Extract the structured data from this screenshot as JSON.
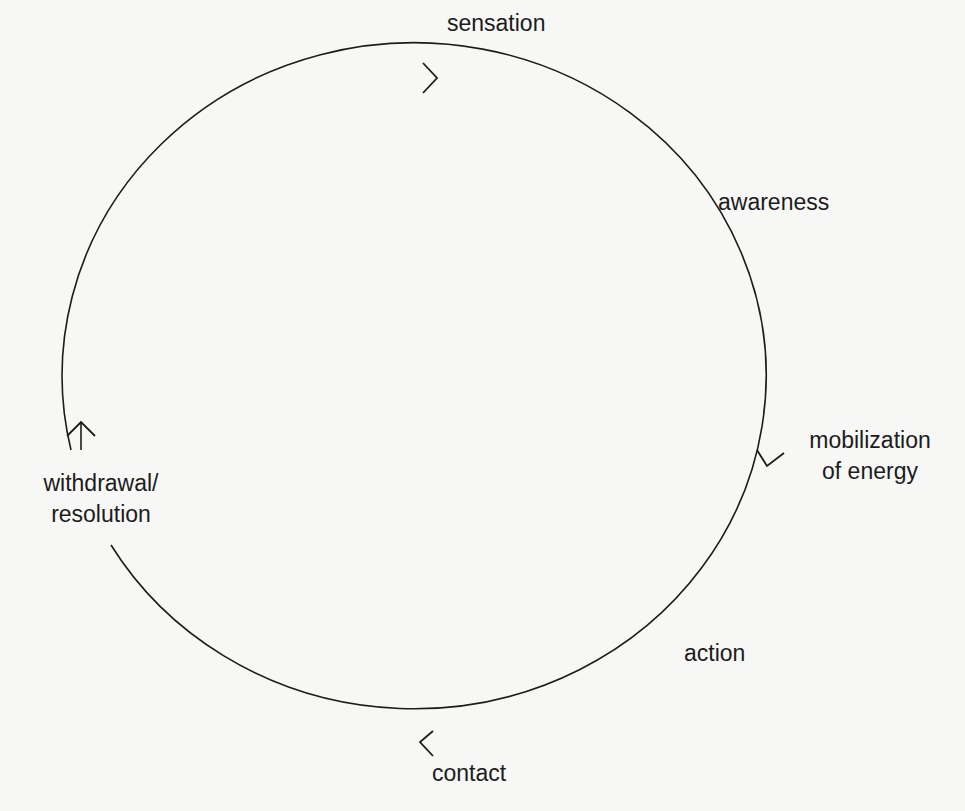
{
  "diagram": {
    "type": "cycle",
    "direction": "clockwise",
    "stroke_color": "#1c1c1c",
    "background_color": "#f7f7f5",
    "stages": [
      {
        "id": "sensation",
        "label": "sensation"
      },
      {
        "id": "awareness",
        "label": "awareness"
      },
      {
        "id": "mobilization",
        "label_line1": "mobilization",
        "label_line2": "of energy"
      },
      {
        "id": "action",
        "label": "action"
      },
      {
        "id": "contact",
        "label": "contact"
      },
      {
        "id": "withdrawal",
        "label_line1": "withdrawal/",
        "label_line2": "resolution"
      }
    ],
    "arrows": [
      {
        "position": "top",
        "direction": "right"
      },
      {
        "position": "right",
        "direction": "down"
      },
      {
        "position": "bottom",
        "direction": "left"
      },
      {
        "position": "left",
        "direction": "up"
      }
    ]
  }
}
